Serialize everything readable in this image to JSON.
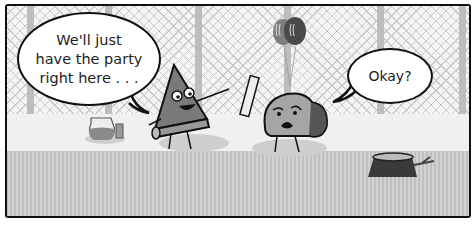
{
  "comic": {
    "panel_count": 1,
    "speech": [
      {
        "speaker": "pizza-slice",
        "lines": [
          "We'll just",
          "have the party",
          "right here . . ."
        ]
      },
      {
        "speaker": "taco",
        "lines": [
          "Okay?"
        ]
      }
    ],
    "scene": {
      "background": "chain-link fence",
      "props": [
        "balloons",
        "pitcher",
        "cup",
        "tree stump",
        "rolled paper"
      ],
      "ground": "grass"
    },
    "colors": {
      "outline": "#111111",
      "fence": "#c9c9c9",
      "grass": "#c8c8c8",
      "paper": "#f3f3f3"
    }
  }
}
